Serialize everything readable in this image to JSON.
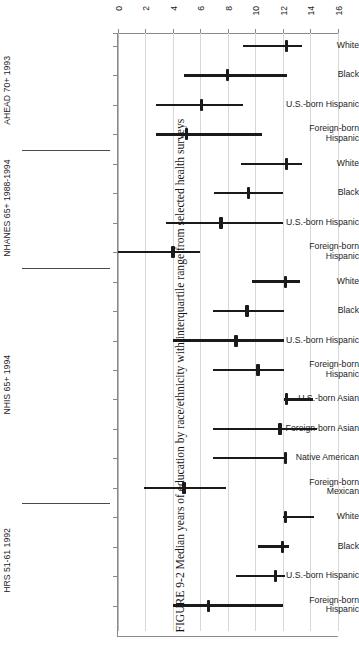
{
  "figure": {
    "number": "FIGURE 9-2",
    "caption": "FIGURE 9-2  Median years of education by race/ethnicity with interquartile range from selected health surveys"
  },
  "chart_data": {
    "type": "bar",
    "subtype": "median-with-interquartile-range",
    "title": "Median years of education by race/ethnicity with interquartile range from selected health surveys",
    "xlabel": "",
    "ylabel": "",
    "orientation": "horizontal",
    "rotated_page": true,
    "xlim": [
      0,
      16
    ],
    "xticks": [
      0,
      2,
      4,
      6,
      8,
      10,
      12,
      14,
      16
    ],
    "xticklabels": [
      "0",
      "2",
      "4",
      "6",
      "8",
      "10",
      "12",
      "14",
      "16"
    ],
    "grid": true,
    "legend": "none",
    "value_unit": "years of education",
    "groups": [
      {
        "name": "AHEAD 70+ 1993",
        "rows": [
          {
            "label": "White",
            "median": 12.3,
            "q1": 9.1,
            "q3": 13.4
          },
          {
            "label": "Black",
            "median": 8.0,
            "q1": 4.8,
            "q3": 12.3
          },
          {
            "label": "U.S.-born Hispanic",
            "median": 6.1,
            "q1": 2.8,
            "q3": 9.1
          },
          {
            "label": "Foreign-born\nHispanic",
            "median": 5.0,
            "q1": 2.8,
            "q3": 10.5
          }
        ]
      },
      {
        "name": "NHANES 65+ 1988-1994",
        "rows": [
          {
            "label": "White",
            "median": 12.3,
            "q1": 9.0,
            "q3": 13.4
          },
          {
            "label": "Black",
            "median": 9.5,
            "q1": 7.0,
            "q3": 12.0
          },
          {
            "label": "U.S.-born Hispanic",
            "median": 7.5,
            "q1": 3.5,
            "q3": 12.0
          },
          {
            "label": "Foreign-born\nHispanic",
            "median": 4.0,
            "q1": 0.0,
            "q3": 6.0
          }
        ]
      },
      {
        "name": "NHIS 65+ 1994",
        "rows": [
          {
            "label": "White",
            "median": 12.2,
            "q1": 9.8,
            "q3": 13.3
          },
          {
            "label": "Black",
            "median": 9.4,
            "q1": 6.9,
            "q3": 12.1
          },
          {
            "label": "U.S.-born Hispanic",
            "median": 8.6,
            "q1": 4.0,
            "q3": 12.1
          },
          {
            "label": "Foreign-born\nHispanic",
            "median": 10.2,
            "q1": 6.9,
            "q3": 12.1
          },
          {
            "label": "U.S.-born Asian",
            "median": 12.3,
            "q1": 12.1,
            "q3": 14.2
          },
          {
            "label": "Foreign-born Asian",
            "median": 11.8,
            "q1": 6.9,
            "q3": 14.5
          },
          {
            "label": "Native American",
            "median": 12.2,
            "q1": 6.9,
            "q3": 12.3
          },
          {
            "label": "Foreign-born\nMexican",
            "median": 4.8,
            "q1": 1.9,
            "q3": 7.9
          }
        ]
      },
      {
        "name": "HRS 51-61 1992",
        "rows": [
          {
            "label": "White",
            "median": 12.2,
            "q1": 12.0,
            "q3": 14.3
          },
          {
            "label": "Black",
            "median": 12.0,
            "q1": 10.2,
            "q3": 12.5
          },
          {
            "label": "U.S.-born Hispanic",
            "median": 11.5,
            "q1": 8.6,
            "q3": 12.2
          },
          {
            "label": "Foreign-born\nHispanic",
            "median": 6.6,
            "q1": 4.0,
            "q3": 12.0
          }
        ]
      }
    ]
  },
  "colors": {
    "mark": "#1a1a1a",
    "grid": "#d8d8d8",
    "axis": "#8a8a8a",
    "separator": "#4a4a4a",
    "text": "#1d1d1d",
    "background": "#ffffff"
  }
}
